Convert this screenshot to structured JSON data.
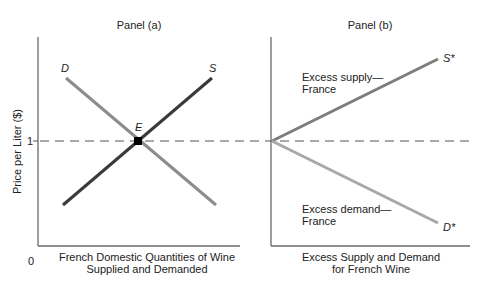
{
  "panels": [
    {
      "title": "Panel (a)",
      "xlabel_line1": "French Domestic Quantities of Wine",
      "xlabel_line2": "Supplied and Demanded",
      "curves": {
        "demand_label": "D",
        "supply_label": "S",
        "equilibrium_label": "E"
      }
    },
    {
      "title": "Panel (b)",
      "xlabel_line1": "Excess Supply and Demand",
      "xlabel_line2": "for French Wine",
      "curves": {
        "supply_label": "S*",
        "demand_label": "D*",
        "excess_supply_line1": "Excess supply—",
        "excess_supply_line2": "France",
        "excess_demand_line1": "Excess demand—",
        "excess_demand_line2": "France"
      }
    }
  ],
  "ylabel": "Price per Liter ($)",
  "y_tick": "1",
  "origin_label": "0",
  "colors": {
    "axis": "#6a6a6a",
    "supply_dark": "#3a3a3a",
    "demand_gray": "#8c8c8c",
    "excess_supply": "#7d7d7d",
    "excess_demand": "#a8a8a8",
    "dashed": "#555555",
    "equilibrium_point": "#000000"
  }
}
